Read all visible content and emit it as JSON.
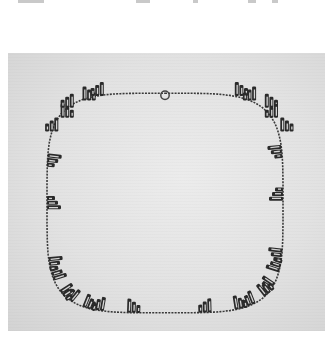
{
  "page": {
    "type": "scanned book page",
    "colors": {
      "paper": "#ffffff",
      "photo_background": "#e2e2e2",
      "metal_dark": "#2a2a2a",
      "metal_highlight": "#f4f4f4"
    }
  },
  "figure": {
    "alt": "Black-and-white photograph of a necklace with stepped, bar-shaped silver pendants linked by a fine chain, with a round spring-ring clasp at top center",
    "subject": "necklace",
    "clasp": "spring-ring clasp",
    "pendant_style": "stepped cluster of vertical bars",
    "pendant_count": 30
  }
}
